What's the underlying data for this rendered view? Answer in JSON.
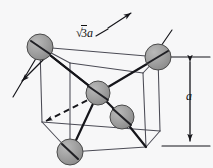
{
  "figure": {
    "background_color": "#f7f7f8",
    "line_color": "#3a3a44",
    "heavy_line_color": "#15151a",
    "sphere_fill": "#9a9a9a",
    "sphere_stroke": "#4a4a4a"
  },
  "labels": {
    "body_diagonal": {
      "radical": "√",
      "radicand": "3",
      "variable": "a",
      "full": "√3a"
    },
    "edge_length": {
      "variable": "a",
      "full": "a"
    }
  },
  "atoms": [
    {
      "name": "corner-atom-back-top-left",
      "cx": 40,
      "cy": 47,
      "r": 13
    },
    {
      "name": "corner-atom-back-top-right",
      "cx": 158,
      "cy": 57,
      "r": 13
    },
    {
      "name": "body-center-atom",
      "cx": 98,
      "cy": 93,
      "r": 12
    },
    {
      "name": "corner-atom-front-bottom-right",
      "cx": 122,
      "cy": 117,
      "r": 12
    },
    {
      "name": "corner-atom-front-bottom-left",
      "cx": 70,
      "cy": 152,
      "r": 13
    }
  ],
  "cube_vertices": {
    "back_top_left": [
      40,
      47
    ],
    "back_top_right": [
      158,
      57
    ],
    "front_top_left": [
      70,
      63
    ],
    "front_top_right": [
      143,
      73
    ],
    "back_bottom_left": [
      42,
      122
    ],
    "back_bottom_right": [
      160,
      131
    ],
    "front_bottom_left": [
      70,
      152
    ],
    "front_bottom_right": [
      146,
      147
    ]
  },
  "dimension_lines": {
    "body_diagonal_label_anchor": [
      76,
      27
    ],
    "vertical_a_label_anchor": [
      186,
      90
    ],
    "vertical_top_y": 57,
    "vertical_bottom_y": 147,
    "vertical_x": 190
  }
}
